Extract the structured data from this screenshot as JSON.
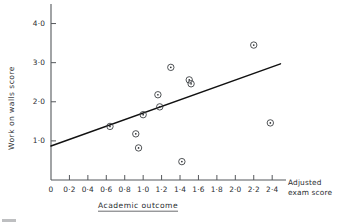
{
  "figure": {
    "background_color": "#ffffff",
    "ink_color": "#2a2d30",
    "line_color": "#111111"
  },
  "chart_data": {
    "type": "scatter",
    "title": "",
    "xlabel": "Academic outcome",
    "ylabel": "Work on walls score",
    "x_axis_end_label_line1": "Adjusted",
    "x_axis_end_label_line2": "exam score",
    "xlim": [
      0,
      2.55
    ],
    "ylim": [
      0,
      4.5
    ],
    "grid": false,
    "legend": "none",
    "xtick_values": [
      0,
      0.2,
      0.4,
      0.6,
      0.8,
      1.0,
      1.2,
      1.4,
      1.6,
      1.8,
      2.0,
      2.2,
      2.4
    ],
    "xtick_labels": [
      "0",
      "0·2",
      "0·4",
      "0·6",
      "0·8",
      "1·0",
      "1·2",
      "1·4",
      "1·6",
      "1·8",
      "2·0",
      "2·2",
      "2·4"
    ],
    "ytick_values": [
      1.0,
      2.0,
      3.0,
      4.0
    ],
    "ytick_labels": [
      "1·0",
      "2·0",
      "3·0",
      "4·0"
    ],
    "marker_style": "circle-with-center-dot",
    "points": [
      {
        "x": 0.64,
        "y": 1.37
      },
      {
        "x": 0.92,
        "y": 1.18
      },
      {
        "x": 0.95,
        "y": 0.82
      },
      {
        "x": 1.0,
        "y": 1.67
      },
      {
        "x": 1.16,
        "y": 2.18
      },
      {
        "x": 1.18,
        "y": 1.87
      },
      {
        "x": 1.3,
        "y": 2.88
      },
      {
        "x": 1.42,
        "y": 0.47
      },
      {
        "x": 1.5,
        "y": 2.56
      },
      {
        "x": 1.52,
        "y": 2.46
      },
      {
        "x": 2.2,
        "y": 3.45
      },
      {
        "x": 2.38,
        "y": 1.46
      }
    ],
    "regression_line": {
      "x_start": 0.0,
      "y_start": 0.87,
      "x_end": 2.49,
      "y_end": 2.97
    }
  }
}
